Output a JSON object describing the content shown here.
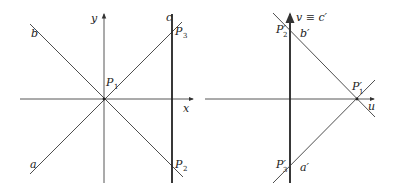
{
  "colors": {
    "line": "#3a3a3a",
    "thick": "#222222",
    "background": "#ffffff"
  },
  "left_diagram": {
    "axes": {
      "x_label": "x",
      "y_label": "y"
    },
    "lines": {
      "a": "a",
      "b": "b",
      "c": "c"
    },
    "points": {
      "P1": {
        "name": "P",
        "sub": "1"
      },
      "P2": {
        "name": "P",
        "sub": "2"
      },
      "P3": {
        "name": "P",
        "sub": "3"
      }
    }
  },
  "right_diagram": {
    "axes": {
      "u_label": "u",
      "v_label": "v ≡ c′"
    },
    "lines": {
      "a_prime": "a′",
      "b_prime": "b′"
    },
    "points": {
      "P1p": {
        "name": "P′",
        "sub": "1"
      },
      "P2p": {
        "name": "P′",
        "sub": "2"
      },
      "P3p": {
        "name": "P′",
        "sub": "3"
      }
    }
  }
}
